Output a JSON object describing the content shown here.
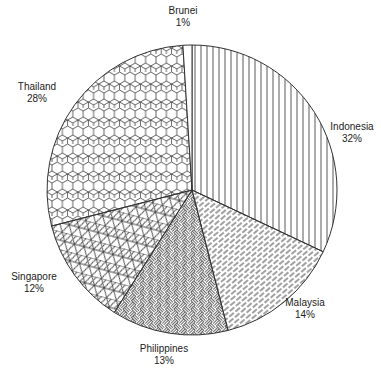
{
  "chart_data": {
    "type": "pie",
    "title": "",
    "categories": [
      "Indonesia",
      "Malaysia",
      "Philippines",
      "Singapore",
      "Thailand",
      "Brunei"
    ],
    "values": [
      32,
      14,
      13,
      12,
      28,
      1
    ],
    "value_labels": [
      "32%",
      "14%",
      "13%",
      "12%",
      "28%",
      "1%"
    ],
    "start_angle": "12 o'clock",
    "direction": "clockwise",
    "legend": "none (direct labels)",
    "patterns": [
      "vertical-lines",
      "diagonal-dashes",
      "basketweave",
      "triangle-grid",
      "hexagons",
      "none"
    ],
    "stroke_color": "#333333",
    "fill_color": "#ffffff"
  },
  "geometry": {
    "cx": 192,
    "cy": 190,
    "r": 145
  },
  "labels": [
    {
      "name": "Indonesia",
      "pct": "32%",
      "x": 352,
      "y": 130
    },
    {
      "name": "Malaysia",
      "pct": "14%",
      "x": 305,
      "y": 306
    },
    {
      "name": "Philippines",
      "pct": "13%",
      "x": 164,
      "y": 352
    },
    {
      "name": "Singapore",
      "pct": "12%",
      "x": 34,
      "y": 280
    },
    {
      "name": "Thailand",
      "pct": "28%",
      "x": 37,
      "y": 90
    },
    {
      "name": "Brunei",
      "pct": "1%",
      "x": 183,
      "y": 14
    }
  ]
}
